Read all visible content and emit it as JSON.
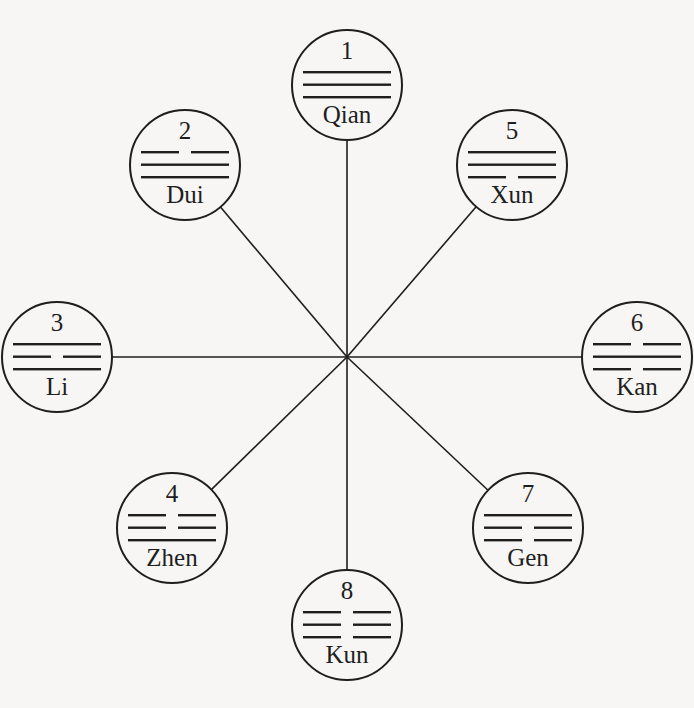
{
  "diagram": {
    "type": "trigram-octagon",
    "center": [
      347,
      357
    ],
    "nodes": [
      {
        "number": "1",
        "name": "Qian",
        "cx": 347,
        "cy": 85,
        "r": 55,
        "lines": [
          "solid",
          "solid",
          "solid"
        ]
      },
      {
        "number": "2",
        "name": "Dui",
        "cx": 185,
        "cy": 165,
        "r": 55,
        "lines": [
          "broken",
          "solid",
          "solid"
        ]
      },
      {
        "number": "3",
        "name": "Li",
        "cx": 57,
        "cy": 357,
        "r": 55,
        "lines": [
          "solid",
          "broken",
          "solid"
        ]
      },
      {
        "number": "4",
        "name": "Zhen",
        "cx": 172,
        "cy": 528,
        "r": 55,
        "lines": [
          "broken",
          "broken",
          "solid"
        ]
      },
      {
        "number": "5",
        "name": "Xun",
        "cx": 512,
        "cy": 165,
        "r": 55,
        "lines": [
          "solid",
          "solid",
          "broken"
        ]
      },
      {
        "number": "6",
        "name": "Kan",
        "cx": 637,
        "cy": 357,
        "r": 55,
        "lines": [
          "broken",
          "solid",
          "broken"
        ]
      },
      {
        "number": "7",
        "name": "Gen",
        "cx": 528,
        "cy": 528,
        "r": 55,
        "lines": [
          "solid",
          "broken",
          "broken"
        ]
      },
      {
        "number": "8",
        "name": "Kun",
        "cx": 347,
        "cy": 625,
        "r": 55,
        "lines": [
          "broken",
          "broken",
          "broken"
        ]
      }
    ],
    "colors": {
      "ink": "#1e1e1e",
      "paper": "#f7f6f4"
    }
  }
}
